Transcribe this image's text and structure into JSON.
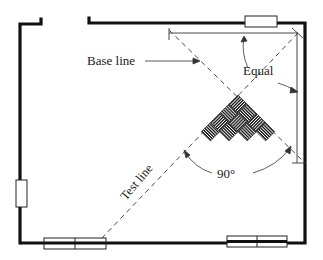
{
  "diagram": {
    "labels": {
      "base_line": "Base line",
      "test_line": "Test line",
      "equal": "Equal",
      "angle": "90°"
    },
    "colors": {
      "wall": "#111111",
      "line": "#333333",
      "background": "#ffffff"
    }
  }
}
